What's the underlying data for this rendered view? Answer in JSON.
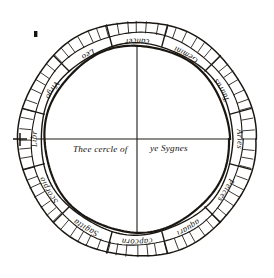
{
  "figure": {
    "title_text_left": "Thee cercle of",
    "title_text_right": "ye Sygnes",
    "page_mark": "▪",
    "ink_color": "#17140f",
    "paper_color": "#ffffff",
    "outer_radius": 118,
    "band_outer_radius": 118,
    "band_middle_radius": 106,
    "band_inner_radius": 96,
    "inner_circle_radius": 93,
    "center_x": 137,
    "center_y": 139,
    "tick_count": 72,
    "segment_count": 12,
    "has_vertical_diameter": true,
    "has_horizontal_diameter": true,
    "left_cross_tick": "+"
  },
  "zodiac": {
    "labels": [
      {
        "name": "Cancer",
        "text": "cancer",
        "index": 0,
        "start_deg": 255,
        "mid_deg": 270
      },
      {
        "name": "Gemini",
        "text": "Gemini",
        "index": 1,
        "start_deg": 285,
        "mid_deg": 300
      },
      {
        "name": "Taurus",
        "text": "Taurus",
        "index": 2,
        "start_deg": 315,
        "mid_deg": 330
      },
      {
        "name": "Aries",
        "text": "Aries",
        "index": 3,
        "start_deg": 345,
        "mid_deg": 0
      },
      {
        "name": "Pisces",
        "text": "Pelces",
        "index": 4,
        "start_deg": 15,
        "mid_deg": 30
      },
      {
        "name": "Aquarius",
        "text": "aquari",
        "index": 5,
        "start_deg": 45,
        "mid_deg": 60
      },
      {
        "name": "Capricorn",
        "text": "capcorn",
        "index": 6,
        "start_deg": 75,
        "mid_deg": 90
      },
      {
        "name": "Sagittarius",
        "text": "Sagitta",
        "index": 7,
        "start_deg": 105,
        "mid_deg": 120
      },
      {
        "name": "Scorpio",
        "text": "Scorpio",
        "index": 8,
        "start_deg": 135,
        "mid_deg": 150
      },
      {
        "name": "Libra",
        "text": "Libr",
        "index": 9,
        "start_deg": 165,
        "mid_deg": 180
      },
      {
        "name": "Virgo",
        "text": "Virgo",
        "index": 10,
        "start_deg": 195,
        "mid_deg": 210
      },
      {
        "name": "Leo",
        "text": "Leo",
        "index": 11,
        "start_deg": 225,
        "mid_deg": 240
      }
    ]
  }
}
